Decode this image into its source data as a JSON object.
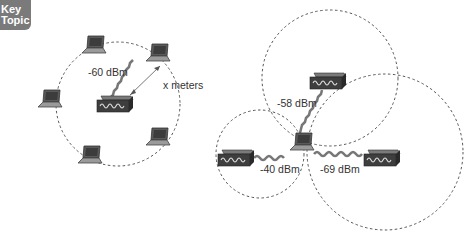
{
  "badge": {
    "line1": "Key",
    "line2": "Topic",
    "color": "#7a7a7a"
  },
  "left_diagram": {
    "signal_label": "-60 dBm",
    "distance_label": "x meters",
    "circle": {
      "cx": 118,
      "cy": 104,
      "r": 62
    },
    "ap": {
      "x": 97,
      "y": 96
    },
    "laptops": [
      {
        "x": 84,
        "y": 36
      },
      {
        "x": 148,
        "y": 44
      },
      {
        "x": 40,
        "y": 90
      },
      {
        "x": 148,
        "y": 128
      },
      {
        "x": 80,
        "y": 146
      }
    ]
  },
  "right_diagram": {
    "labels": {
      "top": "-58 dBm",
      "left": "-40 dBm",
      "right": "-69 dBm"
    },
    "circles": [
      {
        "name": "top",
        "cx": 330,
        "cy": 78,
        "r": 68
      },
      {
        "name": "left",
        "cx": 260,
        "cy": 154,
        "r": 44
      },
      {
        "name": "right",
        "cx": 385,
        "cy": 152,
        "r": 78
      }
    ],
    "aps": [
      {
        "name": "top",
        "x": 310,
        "y": 73
      },
      {
        "name": "left",
        "x": 218,
        "y": 150
      },
      {
        "name": "right",
        "x": 364,
        "y": 150
      }
    ],
    "laptop": {
      "x": 290,
      "y": 133
    }
  },
  "colors": {
    "device": "#4a4a4a",
    "device_top": "#6a6a6a",
    "dashed": "#555555",
    "wave": "#777777"
  }
}
